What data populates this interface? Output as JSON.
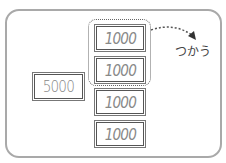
{
  "diagram": {
    "large_bill": {
      "value": "5000"
    },
    "small_bills": [
      {
        "value": "1000",
        "used": true
      },
      {
        "value": "1000",
        "used": true
      },
      {
        "value": "1000",
        "used": false
      },
      {
        "value": "1000",
        "used": false
      }
    ],
    "action_label": "つかう",
    "colors": {
      "frame": "#a9a9a9",
      "bill_border": "#555555",
      "bill_text": "#888888",
      "label_text": "#444444"
    }
  }
}
